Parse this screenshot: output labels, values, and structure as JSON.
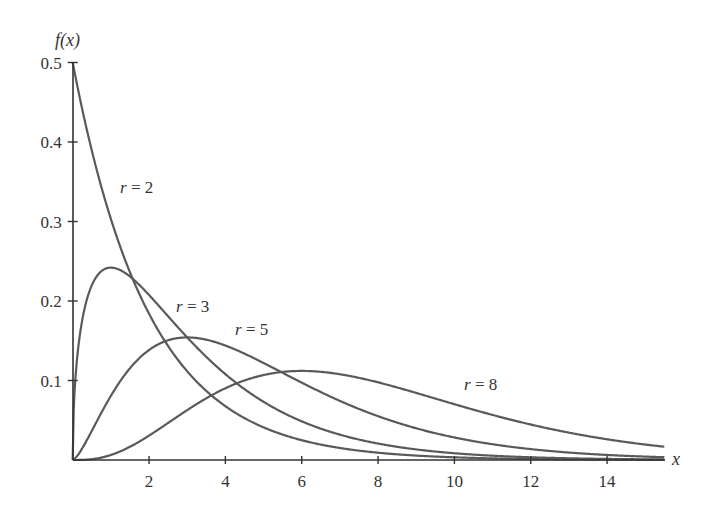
{
  "chart_data": {
    "type": "line",
    "title": "",
    "xlabel": "x",
    "ylabel": "f(x)",
    "xlim": [
      0,
      15.5
    ],
    "ylim": [
      0,
      0.5
    ],
    "grid": false,
    "legend": "inline labels",
    "x_ticks": [
      2,
      4,
      6,
      8,
      10,
      12,
      14
    ],
    "x_tick_labels": [
      "2",
      "4",
      "6",
      "8",
      "10",
      "12",
      "14"
    ],
    "y_ticks": [
      0.1,
      0.2,
      0.3,
      0.4,
      0.5
    ],
    "y_tick_labels": [
      "0.1",
      "0.2",
      "0.3",
      "0.4",
      "0.5"
    ],
    "x": [
      0,
      1,
      2,
      3,
      4,
      5,
      6,
      7,
      8,
      9,
      10,
      11,
      12,
      13,
      14,
      15
    ],
    "series": [
      {
        "name": "r = 2",
        "r": 2,
        "values": [
          0.5,
          0.303,
          0.184,
          0.112,
          0.068,
          0.041,
          0.025,
          0.015,
          0.009,
          0.006,
          0.003,
          0.002,
          0.001,
          0.001,
          0.0,
          0.0
        ]
      },
      {
        "name": "r = 3",
        "r": 3,
        "values": [
          0,
          0.242,
          0.208,
          0.154,
          0.108,
          0.073,
          0.049,
          0.032,
          0.021,
          0.013,
          0.008,
          0.005,
          0.003,
          0.002,
          0.001,
          0.001
        ]
      },
      {
        "name": "r = 5",
        "r": 5,
        "values": [
          0,
          0.081,
          0.138,
          0.154,
          0.144,
          0.122,
          0.098,
          0.076,
          0.057,
          0.042,
          0.03,
          0.021,
          0.015,
          0.01,
          0.007,
          0.005
        ]
      },
      {
        "name": "r = 8",
        "r": 8,
        "values": [
          0,
          0.006,
          0.031,
          0.066,
          0.09,
          0.107,
          0.112,
          0.11,
          0.102,
          0.092,
          0.08,
          0.068,
          0.056,
          0.046,
          0.037,
          0.029
        ]
      }
    ],
    "annotations": [
      {
        "text_var": "r",
        "text_eq": " = 2",
        "x": 120,
        "y": 193
      },
      {
        "text_var": "r",
        "text_eq": " = 3",
        "x": 176,
        "y": 312
      },
      {
        "text_var": "r",
        "text_eq": " = 5",
        "x": 235,
        "y": 335
      },
      {
        "text_var": "r",
        "text_eq": " = 8",
        "x": 464,
        "y": 390
      }
    ],
    "colors": {
      "curve": "#5a5a5a",
      "axis": "#333333"
    }
  }
}
